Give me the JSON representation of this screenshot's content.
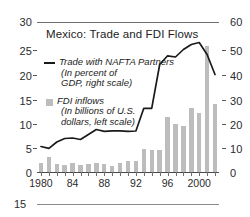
{
  "figure": {
    "title": "Mexico: Trade and FDI Flows",
    "left_axis_ticks": [
      "0",
      "5",
      "10",
      "15",
      "20",
      "25",
      "30"
    ],
    "right_axis_ticks": [
      "0",
      "10",
      "20",
      "30",
      "40",
      "50",
      "60"
    ],
    "x_axis_ticks": [
      "1980",
      "84",
      "88",
      "92",
      "96",
      "2000"
    ],
    "legend": [
      {
        "marker": "line",
        "label": "Trade with NAFTA Partners",
        "sub1": "(In percent of",
        "sub2": "GDP, right scale)"
      },
      {
        "marker": "square",
        "label": "FDI inflows",
        "sub1": "(In billions of U.S.",
        "sub2": "dollars, left scale)"
      }
    ],
    "colors": {
      "line": "#1a1a1a",
      "bar": "#bdbdbd",
      "axis": "#6f6f6f",
      "text": "#231f20"
    }
  },
  "footer_partial_chart": {
    "value_label": "15"
  },
  "chart_data": {
    "type": "bar",
    "title": "Mexico: Trade and FDI Flows",
    "xlabel": "",
    "ylabel": "FDI inflows (In billions of U.S. dollars)",
    "ylabel_right": "Trade with NAFTA Partners (In percent of GDP)",
    "ylim": [
      0,
      30
    ],
    "ylim_right": [
      0,
      60
    ],
    "grid": false,
    "legend_position": "inside-upper-left",
    "x": [
      1980,
      1981,
      1982,
      1983,
      1984,
      1985,
      1986,
      1987,
      1988,
      1989,
      1990,
      1991,
      1992,
      1993,
      1994,
      1995,
      1996,
      1997,
      1998,
      1999,
      2000,
      2001,
      2002
    ],
    "xtick_labels": {
      "1980": "1980",
      "1984": "84",
      "1988": "88",
      "1992": "92",
      "1996": "96",
      "2000": "2000"
    },
    "series": [
      {
        "name": "FDI inflows",
        "type": "bar",
        "axis": "left",
        "unit": "billions of U.S. dollars",
        "color": "#bdbdbd",
        "values": [
          1.9,
          3.0,
          1.7,
          1.4,
          1.9,
          1.5,
          1.6,
          1.8,
          1.6,
          1.2,
          1.9,
          2.3,
          2.2,
          4.7,
          4.4,
          4.4,
          11.0,
          9.6,
          9.3,
          12.8,
          11.9,
          25.3,
          13.6
        ]
      },
      {
        "name": "Trade with NAFTA Partners",
        "type": "line",
        "axis": "right",
        "unit": "percent of GDP",
        "color": "#1a1a1a",
        "values": [
          10.2,
          9.5,
          12.0,
          13.4,
          13.6,
          13.0,
          15.0,
          17.0,
          16.3,
          16.5,
          16.5,
          16.3,
          16.4,
          25.5,
          25.5,
          43.0,
          46.5,
          46.0,
          49.0,
          51.0,
          51.8,
          47.0,
          39.0
        ]
      }
    ]
  }
}
